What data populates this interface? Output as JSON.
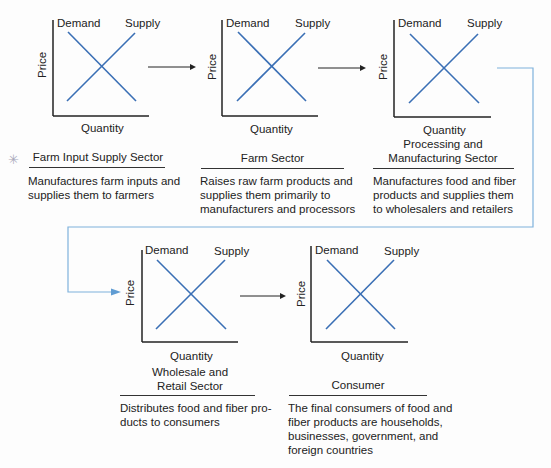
{
  "colors": {
    "curve": "#3a6fb5",
    "connector": "#7fb2dc",
    "axis": "#222222"
  },
  "charts": [
    {
      "demand": "Demand",
      "supply": "Supply",
      "ylabel": "Price",
      "xlabel": "Quantity"
    },
    {
      "demand": "Demand",
      "supply": "Supply",
      "ylabel": "Price",
      "xlabel": "Quantity"
    },
    {
      "demand": "Demand",
      "supply": "Supply",
      "ylabel": "Price",
      "xlabel": "Quantity"
    },
    {
      "demand": "Demand",
      "supply": "Supply",
      "ylabel": "Price",
      "xlabel": "Quantity"
    },
    {
      "demand": "Demand",
      "supply": "Supply",
      "ylabel": "Price",
      "xlabel": "Quantity"
    }
  ],
  "sectors": [
    {
      "title_line1": "",
      "title_line2": "Farm Input Supply Sector",
      "desc": [
        "Manufactures farm inputs and",
        "supplies them to farmers"
      ]
    },
    {
      "title_line1": "",
      "title_line2": "Farm Sector",
      "desc": [
        "Raises raw farm products and",
        "supplies them primarily to",
        "manufacturers and processors"
      ]
    },
    {
      "title_line1": "Processing and",
      "title_line2": "Manufacturing Sector",
      "desc": [
        "Manufactures food and fiber",
        "products and supplies them",
        "to wholesalers and retailers"
      ]
    },
    {
      "title_line1": "Wholesale and",
      "title_line2": "Retail Sector",
      "desc": [
        "Distributes food and fiber pro-",
        "ducts to consumers"
      ]
    },
    {
      "title_line1": "",
      "title_line2": "Consumer",
      "desc": [
        "The final consumers of food and",
        "fiber products are households,",
        "businesses, government, and",
        "foreign countries"
      ]
    }
  ],
  "marks": {
    "star": "✳"
  }
}
